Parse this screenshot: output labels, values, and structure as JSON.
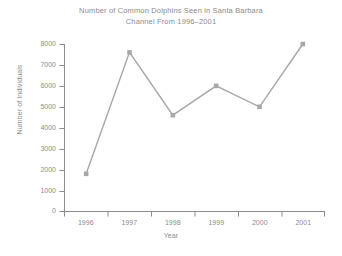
{
  "chart_data": {
    "type": "line",
    "title": "Number of Common Dolphins Seen in Santa Barbara Channel From 1996–2001",
    "title_lines": [
      "Number of Common Dolphins Seen in Santa Barbara",
      "Channel From 1996–2001"
    ],
    "xlabel": "Year",
    "ylabel": "Number of Individuals",
    "categories": [
      "1996",
      "1997",
      "1998",
      "1999",
      "2000",
      "2001"
    ],
    "values": [
      1800,
      7600,
      4600,
      6000,
      5000,
      8000
    ],
    "series": [
      {
        "name": "Common Dolphins",
        "values": [
          1800,
          7600,
          4600,
          6000,
          5000,
          8000
        ]
      }
    ],
    "ylim": [
      0,
      8000
    ],
    "ytick_labels": [
      "0",
      "1000",
      "2000",
      "3000",
      "4000",
      "5000",
      "6000",
      "7000",
      "8000"
    ],
    "ytick_values": [
      0,
      1000,
      2000,
      3000,
      4000,
      5000,
      6000,
      7000,
      8000
    ],
    "xtick_labels": [
      "1996",
      "1997",
      "1998",
      "1999",
      "2000",
      "2001"
    ],
    "grid": false,
    "legend": false,
    "marker": "square",
    "line_color": "#a8a8a8",
    "marker_color": "#a8a8a8",
    "axis_color": "#8c8c8c",
    "text_color": "#8c8c8c",
    "background_color": "#ffffff"
  }
}
